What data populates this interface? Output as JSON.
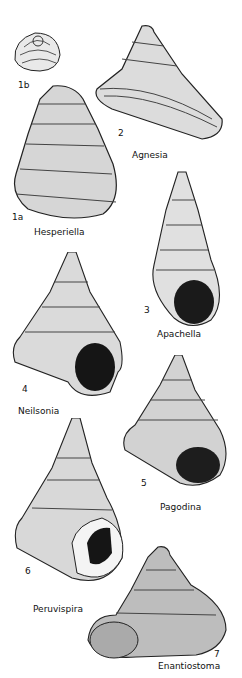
{
  "plate": {
    "background": "#ffffff",
    "ink": "#111111",
    "figures": [
      {
        "id": "1b",
        "number": "1b",
        "name": ""
      },
      {
        "id": "2",
        "number": "2",
        "name": "Agnesia"
      },
      {
        "id": "1a",
        "number": "1a",
        "name": "Hesperiella"
      },
      {
        "id": "3",
        "number": "3",
        "name": "Apachella"
      },
      {
        "id": "4",
        "number": "4",
        "name": "Neilsonia"
      },
      {
        "id": "5",
        "number": "5",
        "name": "Pagodina"
      },
      {
        "id": "6",
        "number": "6",
        "name": "Peruvispira"
      },
      {
        "id": "7",
        "number": "7",
        "name": "Enantiostoma"
      }
    ]
  }
}
